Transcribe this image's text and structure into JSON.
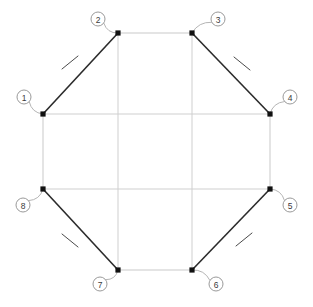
{
  "diagram": {
    "type": "geometric-line-diagram",
    "canvas": {
      "width": 313,
      "height": 307,
      "background": "#ffffff"
    },
    "colors": {
      "diagonal_edge": "#2b2b2b",
      "orthogonal_edge": "#c9c9c9",
      "grid_line": "#cfcfcf",
      "vertex_dot": "#111111",
      "leader_line": "#b5b5b5",
      "label_circle_stroke": "#9a9a9a",
      "label_text": "#3a3a3a",
      "tick_mark": "#4a4a4a"
    },
    "vertices": [
      {
        "id": 1,
        "label": "1",
        "x": 43,
        "y": 114,
        "label_x": 24,
        "label_y": 97
      },
      {
        "id": 2,
        "label": "2",
        "x": 118,
        "y": 33,
        "label_x": 98,
        "label_y": 19
      },
      {
        "id": 3,
        "label": "3",
        "x": 192,
        "y": 33,
        "label_x": 218,
        "label_y": 19
      },
      {
        "id": 4,
        "label": "4",
        "x": 270,
        "y": 114,
        "label_x": 290,
        "label_y": 97
      },
      {
        "id": 5,
        "label": "5",
        "x": 270,
        "y": 189,
        "label_x": 290,
        "label_y": 205
      },
      {
        "id": 6,
        "label": "6",
        "x": 192,
        "y": 270,
        "label_x": 216,
        "label_y": 284
      },
      {
        "id": 7,
        "label": "7",
        "x": 118,
        "y": 270,
        "label_x": 100,
        "label_y": 284
      },
      {
        "id": 8,
        "label": "8",
        "x": 43,
        "y": 189,
        "label_x": 23,
        "label_y": 205
      }
    ],
    "edges": [
      {
        "name": "edge-1-2",
        "from": 1,
        "to": 2,
        "style": "diagonal"
      },
      {
        "name": "edge-2-3",
        "from": 2,
        "to": 3,
        "style": "orthogonal"
      },
      {
        "name": "edge-3-4",
        "from": 3,
        "to": 4,
        "style": "diagonal"
      },
      {
        "name": "edge-4-5",
        "from": 4,
        "to": 5,
        "style": "orthogonal"
      },
      {
        "name": "edge-5-6",
        "from": 5,
        "to": 6,
        "style": "diagonal"
      },
      {
        "name": "edge-6-7",
        "from": 6,
        "to": 7,
        "style": "orthogonal"
      },
      {
        "name": "edge-7-8",
        "from": 7,
        "to": 8,
        "style": "diagonal"
      },
      {
        "name": "edge-8-1",
        "from": 8,
        "to": 1,
        "style": "orthogonal"
      }
    ],
    "grid_lines": [
      {
        "name": "grid-vertical-left",
        "x1": 118,
        "y1": 33,
        "x2": 118,
        "y2": 270
      },
      {
        "name": "grid-vertical-right",
        "x1": 192,
        "y1": 33,
        "x2": 192,
        "y2": 270
      },
      {
        "name": "grid-horizontal-top",
        "x1": 43,
        "y1": 114,
        "x2": 270,
        "y2": 114
      },
      {
        "name": "grid-horizontal-bottom",
        "x1": 43,
        "y1": 189,
        "x2": 270,
        "y2": 189
      }
    ],
    "tick_marks": [
      {
        "name": "tick-edge-1-2",
        "x1": 62,
        "y1": 69,
        "x2": 78,
        "y2": 56
      },
      {
        "name": "tick-edge-3-4",
        "x1": 234,
        "y1": 57,
        "x2": 250,
        "y2": 70
      },
      {
        "name": "tick-edge-5-6",
        "x1": 236,
        "y1": 246,
        "x2": 252,
        "y2": 233
      },
      {
        "name": "tick-edge-7-8",
        "x1": 62,
        "y1": 234,
        "x2": 78,
        "y2": 247
      }
    ],
    "label_circle_radius": 7
  }
}
